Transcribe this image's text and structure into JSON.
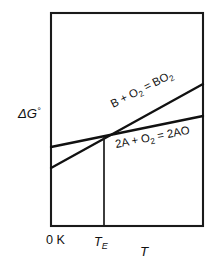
{
  "figure": {
    "background_color": "#ffffff",
    "line_color": "#111111",
    "frame_color": "#1a1a1a"
  },
  "axes": {
    "y_label": "ΔG",
    "y_label_superscript": "°",
    "x_label": "T",
    "x_ticks": [
      {
        "label": "0 K",
        "position": "origin"
      },
      {
        "label": "T",
        "subscript": "E",
        "position": "eutectic"
      }
    ],
    "frame": {
      "left": 51,
      "top": 13,
      "right": 203,
      "bottom": 226
    }
  },
  "chart_data": {
    "type": "line",
    "title": "",
    "xlabel": "T",
    "ylabel": "ΔG°",
    "grid": false,
    "legend": "inline-along-lines",
    "xlim": [
      0,
      1
    ],
    "ylim": [
      0,
      1
    ],
    "annotations": [
      {
        "text_parts": [
          {
            "t": "2A + O",
            "sub": false
          },
          {
            "t": "2",
            "sub": true
          },
          {
            "t": " = 2AO",
            "sub": false
          }
        ],
        "plain_text": "2A + O2 = 2AO",
        "x": 116,
        "y": 148,
        "rotation": -11
      },
      {
        "text_parts": [
          {
            "t": "B + O",
            "sub": false
          },
          {
            "t": "2",
            "sub": true
          },
          {
            "t": " = BO",
            "sub": false
          },
          {
            "t": "2",
            "sub": true
          }
        ],
        "plain_text": "B + O2 = BO2",
        "x": 113,
        "y": 108,
        "rotation": -27
      }
    ],
    "series": [
      {
        "name": "2A + O2 = 2AO",
        "points_px": [
          [
            51,
            147
          ],
          [
            203,
            116
          ]
        ],
        "slope_sign": "positive-shallow",
        "description": "Shallower rising line, higher at 0 K"
      },
      {
        "name": "B + O2 = BO2",
        "points_px": [
          [
            51,
            168
          ],
          [
            203,
            84
          ]
        ],
        "slope_sign": "positive-steep",
        "description": "Steeper rising line, lower at 0 K, crosses the AO line at T_E"
      }
    ],
    "markers": [
      {
        "name": "eutectic-crossover",
        "label": "T_E",
        "x_px": 104,
        "y_px": 137,
        "dropline_to_px": 226
      }
    ]
  },
  "labels": {
    "y_axis": "ΔG°",
    "x_axis": "T",
    "zero_kelvin": "0 K",
    "eutectic_temp_base": "T",
    "eutectic_temp_sub": "E",
    "reaction_bo2": "B + O2 = BO2",
    "reaction_ao": "2A + O2 = 2AO"
  }
}
